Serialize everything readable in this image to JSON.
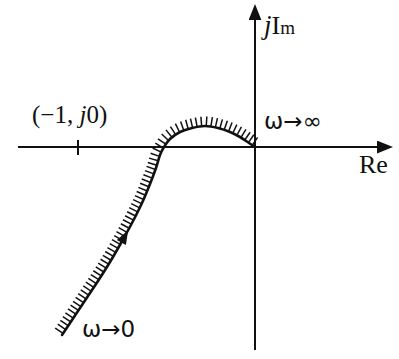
{
  "figure": {
    "background_color": "#ffffff",
    "ink_color": "#111111"
  },
  "axes": {
    "imaginary_label": {
      "full": "jIm",
      "j": "j",
      "I": "I",
      "m": "m"
    },
    "real_label": "Re",
    "origin_px": {
      "x": 255,
      "y": 147
    },
    "real_axis_px": {
      "x1": 18,
      "y1": 147,
      "x2": 385,
      "y2": 147
    },
    "imaginary_axis_px": {
      "x1": 255,
      "y1": 350,
      "x2": 255,
      "y2": 12
    }
  },
  "annotations": {
    "critical_point_label": "(−1, j0)",
    "critical_point_j": "j",
    "critical_point_prefix": "(−1, ",
    "critical_point_suffix": "0)",
    "critical_tick_px": {
      "x": 78,
      "y": 147
    },
    "omega_infinity_label": "ω→∞",
    "omega_zero_label": "ω→0",
    "direction_arrow_note": "arrow on locus points toward increasing ω"
  },
  "chart_data": {
    "type": "line",
    "xlabel": "Re",
    "ylabel": "jIm",
    "grid": false,
    "legend": null,
    "xlim_px": [
      18,
      385
    ],
    "ylim_px": [
      350,
      12
    ],
    "series": [
      {
        "name": "Nyquist locus G(jω)",
        "comment": "Locus starts at lower-left (ω→0), rises through the third/second quadrant, crosses the negative real axis, arcs above the real axis and terminates at the origin (ω→∞). Hatching marks the left/upper side of the locus.",
        "points_px": [
          [
            62,
            335
          ],
          [
            74,
            317
          ],
          [
            86,
            299
          ],
          [
            98,
            281
          ],
          [
            110,
            262
          ],
          [
            121,
            243
          ],
          [
            132,
            223
          ],
          [
            142,
            203
          ],
          [
            150,
            184
          ],
          [
            156,
            168
          ],
          [
            160,
            155
          ],
          [
            164,
            147
          ],
          [
            170,
            139
          ],
          [
            180,
            132
          ],
          [
            192,
            128
          ],
          [
            205,
            126
          ],
          [
            218,
            128
          ],
          [
            230,
            132
          ],
          [
            240,
            137
          ],
          [
            249,
            143
          ],
          [
            255,
            147
          ]
        ],
        "start_label": "ω→0",
        "end_label": "ω→∞",
        "real_axis_crossing_px": [
          152,
          147
        ],
        "peak_px": [
          205,
          126
        ],
        "arrow_marker_px": [
          106,
          226
        ]
      }
    ]
  }
}
